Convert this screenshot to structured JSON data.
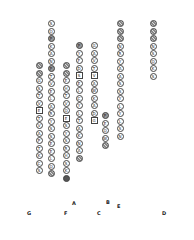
{
  "strands": [
    {
      "name": "G",
      "x": 39,
      "y0": 62,
      "res": [
        [
          "",
          "h"
        ],
        [
          "",
          "h"
        ],
        [
          "G",
          ""
        ],
        [
          "S",
          ""
        ],
        [
          "T",
          ""
        ],
        [
          "V",
          ""
        ],
        [
          "E",
          "sq"
        ],
        [
          "T",
          ""
        ],
        [
          "V",
          ""
        ],
        [
          "A",
          ""
        ],
        [
          "P",
          ""
        ],
        [
          "T",
          ""
        ],
        [
          "K",
          ""
        ],
        [
          "C",
          ""
        ],
        [
          "S",
          ""
        ]
      ]
    },
    {
      "name": "A",
      "x": 51,
      "y0": 20,
      "res": [
        [
          "S",
          ""
        ],
        [
          "Q",
          ""
        ],
        [
          "P",
          "g"
        ],
        [
          "K",
          ""
        ],
        [
          "A",
          ""
        ],
        [
          "N",
          ""
        ],
        [
          "P",
          "g"
        ],
        [
          "T",
          ""
        ],
        [
          "V",
          ""
        ],
        [
          "E",
          ""
        ],
        [
          "L",
          ""
        ],
        [
          "A",
          ""
        ],
        [
          "R",
          ""
        ],
        [
          "Y",
          ""
        ],
        [
          "S",
          ""
        ],
        [
          "S",
          ""
        ],
        [
          "E",
          ""
        ],
        [
          "E",
          ""
        ],
        [
          "L",
          ""
        ],
        [
          "Q",
          ""
        ],
        [
          "",
          "h"
        ]
      ]
    },
    {
      "name": "F",
      "x": 66,
      "y0": 62,
      "res": [
        [
          "",
          "h"
        ],
        [
          "",
          "h"
        ],
        [
          "E",
          ""
        ],
        [
          "H",
          ""
        ],
        [
          "T",
          ""
        ],
        [
          "V",
          ""
        ],
        [
          "Q",
          ""
        ],
        [
          "E",
          "sq"
        ],
        [
          "S",
          ""
        ],
        [
          "Y",
          ""
        ],
        [
          "S",
          ""
        ],
        [
          "R",
          ""
        ],
        [
          "H",
          ""
        ],
        [
          "S",
          ""
        ],
        [
          "K",
          ""
        ],
        [
          "",
          "dk"
        ]
      ]
    },
    {
      "name": "B",
      "x": 79,
      "y0": 42,
      "res": [
        [
          "P",
          "g"
        ],
        [
          "Y",
          ""
        ],
        [
          "F",
          ""
        ],
        [
          "D",
          ""
        ],
        [
          "S",
          "sq"
        ],
        [
          "E",
          ""
        ],
        [
          "L",
          ""
        ],
        [
          "C",
          ""
        ],
        [
          "Y",
          ""
        ],
        [
          "L",
          ""
        ],
        [
          "T",
          ""
        ],
        [
          "A",
          ""
        ],
        [
          "K",
          ""
        ],
        [
          "N",
          ""
        ],
        [
          "A",
          ""
        ],
        [
          "",
          "h"
        ]
      ]
    },
    {
      "name": "C",
      "x": 94,
      "y0": 42,
      "res": [
        [
          "G",
          ""
        ],
        [
          "A",
          ""
        ],
        [
          "V",
          ""
        ],
        [
          "T",
          ""
        ],
        [
          "V",
          "sq"
        ],
        [
          "A",
          ""
        ],
        [
          "W",
          ""
        ],
        [
          "K",
          ""
        ],
        [
          "A",
          ""
        ],
        [
          "D",
          ""
        ],
        [
          "G",
          "sq"
        ]
      ]
    },
    {
      "name": "E",
      "x": 105,
      "y0": 112,
      "res": [
        [
          "P",
          "g"
        ],
        [
          "E",
          ""
        ],
        [
          "Q",
          ""
        ],
        [
          "W",
          ""
        ],
        [
          "",
          "h"
        ]
      ]
    },
    {
      "name": "C2",
      "x": 120,
      "y0": 20,
      "res": [
        [
          "",
          "h"
        ],
        [
          "",
          "h"
        ],
        [
          "",
          "h"
        ],
        [
          "N",
          ""
        ],
        [
          "R",
          ""
        ],
        [
          "Y",
          ""
        ],
        [
          "A",
          ""
        ],
        [
          "A",
          ""
        ],
        [
          "S",
          ""
        ],
        [
          "S",
          ""
        ],
        [
          "Y",
          ""
        ],
        [
          "L",
          ""
        ],
        [
          "Y",
          ""
        ],
        [
          "L",
          ""
        ],
        [
          "S",
          ""
        ],
        [
          "N",
          ""
        ]
      ]
    },
    {
      "name": "D",
      "x": 153,
      "y0": 20,
      "res": [
        [
          "",
          "h"
        ],
        [
          "",
          "h"
        ],
        [
          "",
          "h"
        ],
        [
          "N",
          ""
        ],
        [
          "S",
          ""
        ],
        [
          "Q",
          ""
        ],
        [
          "K",
          ""
        ],
        [
          "S",
          ""
        ]
      ]
    }
  ],
  "labels": {
    "A": "A",
    "B": "B",
    "C": "C",
    "D": "D",
    "E": "E",
    "F": "F",
    "G": "G"
  }
}
